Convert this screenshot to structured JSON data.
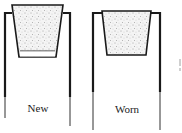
{
  "figure": {
    "panels": [
      {
        "id": "new",
        "label": "New"
      },
      {
        "id": "worn",
        "label": "Worn"
      }
    ],
    "colors": {
      "line": "#1a1a1a",
      "fill_speckle": "#555555",
      "background": "#ffffff"
    }
  }
}
